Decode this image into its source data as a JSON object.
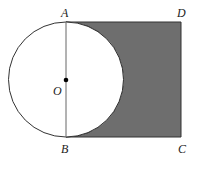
{
  "diagram": {
    "labels": {
      "A": "A",
      "B": "B",
      "C": "C",
      "D": "D",
      "O": "O"
    },
    "shape": {
      "rectangle": [
        "A",
        "B",
        "C",
        "D"
      ],
      "circle_center": "O",
      "circle_diameter": "AB",
      "shaded_region": "rectangle ABCD minus semicircle on AB"
    },
    "colors": {
      "shade": "#6e6e6e",
      "stroke": "#333333",
      "background": "#ffffff"
    }
  }
}
